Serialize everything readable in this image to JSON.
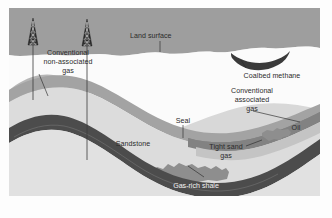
{
  "figure": {
    "type": "geologic-cross-section",
    "background_color": "#fdfdfd"
  },
  "palette": {
    "sky": "#9e9e9e",
    "land_white": "#fbfbfb",
    "sandstone": "#d8d8d8",
    "sandstone_light": "#e4e4e4",
    "seal": "#a8a8a8",
    "gas_reservoir": "#888888",
    "oil_band": "#c2c2c2",
    "shale_dark": "#4c4c4c",
    "coalbed": "#3c3c3c",
    "tight_sand": "#8f8f8f",
    "label_text": "#2b2b2b",
    "label_text_light": "#f2f2f2",
    "leader_line": "#2b2b2b",
    "derrick": "#2e2e2e"
  },
  "labels": {
    "conventional_non_associated_gas": {
      "lines": [
        "Conventional",
        "non-associated",
        "gas"
      ],
      "line1": "Conventional",
      "line2": "non-associated",
      "line3": "gas"
    },
    "land_surface": "Land surface",
    "coalbed_methane": "Coalbed methane",
    "conventional_associated_gas": {
      "lines": [
        "Conventional",
        "associated",
        "gas"
      ],
      "line1": "Conventional",
      "line2": "associated",
      "line3": "gas"
    },
    "oil": "Oil",
    "seal": "Seal",
    "sandstone": "Sandstone",
    "tight_sand_gas": {
      "lines": [
        "Tight sand",
        "gas"
      ],
      "line1": "Tight sand",
      "line2": "gas"
    },
    "gas_rich_shale": "Gas-rich shale"
  },
  "features": {
    "derricks": [
      {
        "name": "derrick-left",
        "x": 32,
        "well_depth": 92
      },
      {
        "name": "derrick-right",
        "x": 86,
        "well_depth": 166
      }
    ],
    "layer_order": [
      "sky",
      "land surface",
      "sandstone",
      "seal",
      "conventional gas reservoir",
      "oil",
      "tight sand gas lenses",
      "gas-rich shale",
      "coalbed methane"
    ]
  }
}
